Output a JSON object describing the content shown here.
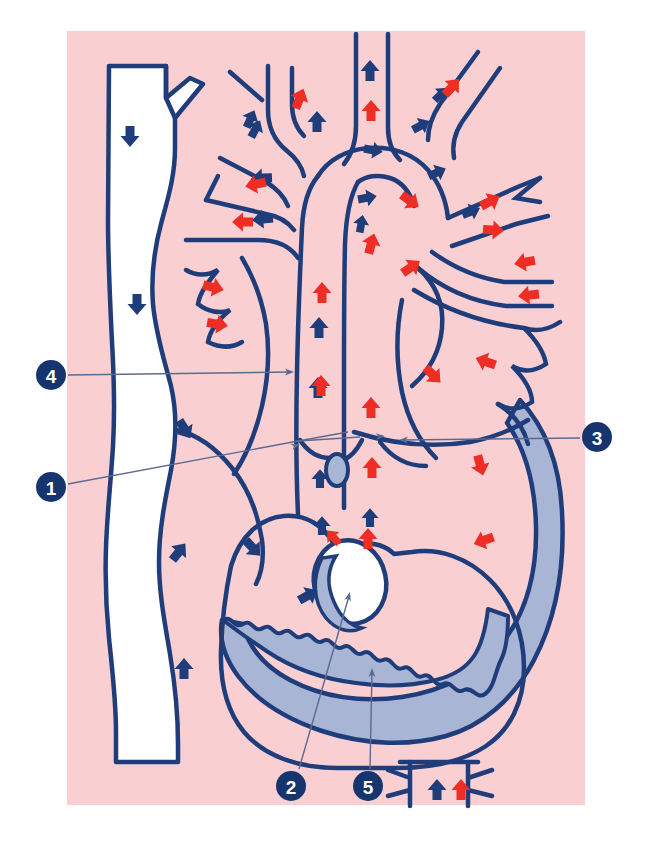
{
  "figure": {
    "type": "anatomical-illustration",
    "canvas": {
      "width": 649,
      "height": 843
    },
    "background": {
      "page_color": "#ffffff",
      "plate_color": "#f9cfd2",
      "plate_rect": {
        "x": 67,
        "y": 31,
        "width": 518,
        "height": 774
      }
    },
    "palette": {
      "outline_blue": "#1f3d7a",
      "deoxygenated_arrow": "#1f3d7a",
      "oxygenated_arrow": "#ee2e24",
      "myocardium_fill": "#a9b5d4",
      "lumen_fill": "#ffffff",
      "plate_pink": "#f9cfd2",
      "callout_disc": "#16356e",
      "callout_text": "#ffffff",
      "leader_line": "#5a6a92"
    }
  },
  "callouts": [
    {
      "id": "callout-1",
      "number": "1",
      "disc": {
        "cx": 51,
        "cy": 487,
        "r": 15
      },
      "leader_paths": [
        "M 68 484 L 298 441 L 348 432",
        "M 298 441 L 360 437"
      ],
      "arrow_tips": [
        {
          "x": 300,
          "y": 444,
          "angle": -20
        },
        {
          "x": 385,
          "y": 436,
          "angle": -4
        }
      ],
      "target": "ascending aorta / aortic root"
    },
    {
      "id": "callout-2",
      "number": "2",
      "disc": {
        "cx": 291,
        "cy": 786,
        "r": 15
      },
      "leader_paths": [
        "M 299 769 L 349 596"
      ],
      "arrow_tips": [
        {
          "x": 350,
          "y": 592,
          "angle": -74
        }
      ],
      "target": "ventricular septal defect"
    },
    {
      "id": "callout-3",
      "number": "3",
      "disc": {
        "cx": 597,
        "cy": 437,
        "r": 15
      },
      "leader_paths": [
        "M 580 438 L 403 440"
      ],
      "arrow_tips": [
        {
          "x": 399,
          "y": 440,
          "angle": 180
        }
      ],
      "target": "left atrium / left ventricle wall"
    },
    {
      "id": "callout-4",
      "number": "4",
      "disc": {
        "cx": 51,
        "cy": 375,
        "r": 15
      },
      "leader_paths": [
        "M 68 375 L 290 372"
      ],
      "arrow_tips": [
        {
          "x": 294,
          "y": 372,
          "angle": 0
        }
      ],
      "target": "superior vena cava / right atrium inflow"
    },
    {
      "id": "callout-5",
      "number": "5",
      "disc": {
        "cx": 368,
        "cy": 786,
        "r": 15
      },
      "leader_paths": [
        "M 370 769 L 372 672"
      ],
      "arrow_tips": [
        {
          "x": 372,
          "y": 668,
          "angle": -90
        }
      ],
      "target": "interventricular septum"
    }
  ],
  "anatomy_shapes": {
    "plate": "M 67 31 L 585 31 L 585 805 L 67 805 Z",
    "left_vena_cava": "M 107 63 L 167 63 L 167 100 L 186 82 L 199 82 L 199 97 L 176 120 L 176 150 C 176 175 169 196 162 222 C 154 252 152 276 154 302 C 157 334 166 360 172 384 C 178 410 178 438 172 470 C 166 500 160 530 160 560 C 160 590 165 620 170 650 C 175 680 178 710 178 740 L 178 760 L 116 760 L 116 730 C 116 700 113 670 110 640 C 107 610 106 580 107 550 C 108 515 112 480 114 445 C 116 410 115 375 113 340 C 111 300 109 260 108 220 C 107 170 107 115 107 63 Z",
    "svc_branch": "M 113 63 L 113 340",
    "heart_outer": "M 230 560 C 238 534 255 520 278 518 C 300 516 318 528 330 545 L 350 545 C 360 545 370 550 378 558 L 400 558 C 420 555 440 560 458 572 C 480 588 498 610 508 640 C 520 676 520 712 505 738 C 490 762 462 775 430 776 L 330 776 C 292 776 258 762 240 735 C 222 708 218 672 222 640 C 224 612 226 585 230 560 Z",
    "aorta_arch": "M 282 200 C 290 180 305 165 325 158 C 348 150 372 154 390 170 C 404 182 412 198 414 216",
    "septum_defect_ellipse": {
      "cx": 350,
      "cy": 582,
      "rx": 36,
      "ry": 42,
      "rotation": -12
    },
    "descending_aorta": "M 408 758 L 408 802 L 470 802 L 470 758 Z"
  },
  "flow_arrows": {
    "legend": {
      "blue_meaning": "deoxygenated (venous) blood flow",
      "red_meaning": "oxygenated (arterial) blood flow"
    },
    "blue": [
      {
        "x": 130,
        "y": 135,
        "angle": 90,
        "scale": 1.0
      },
      {
        "x": 137,
        "y": 303,
        "angle": 90,
        "scale": 1.0
      },
      {
        "x": 184,
        "y": 428,
        "angle": 58,
        "scale": 1.0
      },
      {
        "x": 178,
        "y": 553,
        "angle": -52,
        "scale": 1.0
      },
      {
        "x": 184,
        "y": 670,
        "angle": -90,
        "scale": 1.0
      },
      {
        "x": 252,
        "y": 547,
        "angle": 47,
        "scale": 1.0
      },
      {
        "x": 307,
        "y": 596,
        "angle": -29,
        "scale": 1.0
      },
      {
        "x": 264,
        "y": 219,
        "angle": 174,
        "scale": 1.0
      },
      {
        "x": 263,
        "y": 178,
        "angle": 178,
        "scale": 1.0
      },
      {
        "x": 250,
        "y": 120,
        "angle": -66,
        "scale": 0.9
      },
      {
        "x": 255,
        "y": 130,
        "angle": -62,
        "scale": 0.9
      },
      {
        "x": 317,
        "y": 123,
        "angle": -90,
        "scale": 1.0
      },
      {
        "x": 370,
        "y": 72,
        "angle": -90,
        "scale": 1.0
      },
      {
        "x": 319,
        "y": 329,
        "angle": -90,
        "scale": 1.0
      },
      {
        "x": 318,
        "y": 389,
        "angle": -90,
        "scale": 1.0
      },
      {
        "x": 320,
        "y": 480,
        "angle": -90,
        "scale": 0.9
      },
      {
        "x": 322,
        "y": 527,
        "angle": -90,
        "scale": 0.9
      },
      {
        "x": 370,
        "y": 519,
        "angle": -90,
        "scale": 0.9
      },
      {
        "x": 361,
        "y": 225,
        "angle": -80,
        "scale": 0.85
      },
      {
        "x": 366,
        "y": 198,
        "angle": -10,
        "scale": 0.9
      },
      {
        "x": 372,
        "y": 150,
        "angle": 10,
        "scale": 0.9
      },
      {
        "x": 436,
        "y": 173,
        "angle": -25,
        "scale": 0.9
      },
      {
        "x": 420,
        "y": 126,
        "angle": -28,
        "scale": 0.9
      },
      {
        "x": 470,
        "y": 212,
        "angle": -22,
        "scale": 0.9
      },
      {
        "x": 440,
        "y": 95,
        "angle": -45,
        "scale": 0.85
      },
      {
        "x": 437,
        "y": 791,
        "angle": -90,
        "scale": 1.0
      }
    ],
    "red": [
      {
        "x": 299,
        "y": 100,
        "angle": -68,
        "scale": 1.0
      },
      {
        "x": 371,
        "y": 112,
        "angle": -90,
        "scale": 1.0
      },
      {
        "x": 451,
        "y": 88,
        "angle": -48,
        "scale": 1.0
      },
      {
        "x": 257,
        "y": 184,
        "angle": 168,
        "scale": 1.0
      },
      {
        "x": 244,
        "y": 222,
        "angle": 180,
        "scale": 1.0
      },
      {
        "x": 409,
        "y": 200,
        "angle": 36,
        "scale": 1.0
      },
      {
        "x": 371,
        "y": 245,
        "angle": -75,
        "scale": 1.0
      },
      {
        "x": 410,
        "y": 268,
        "angle": -35,
        "scale": 1.0
      },
      {
        "x": 489,
        "y": 202,
        "angle": -28,
        "scale": 1.0
      },
      {
        "x": 492,
        "y": 230,
        "angle": 4,
        "scale": 1.0
      },
      {
        "x": 212,
        "y": 287,
        "angle": 14,
        "scale": 1.0
      },
      {
        "x": 216,
        "y": 324,
        "angle": 10,
        "scale": 1.0
      },
      {
        "x": 322,
        "y": 294,
        "angle": -90,
        "scale": 1.0
      },
      {
        "x": 321,
        "y": 387,
        "angle": -90,
        "scale": 1.0
      },
      {
        "x": 371,
        "y": 409,
        "angle": -90,
        "scale": 1.0
      },
      {
        "x": 372,
        "y": 469,
        "angle": -90,
        "scale": 1.0
      },
      {
        "x": 368,
        "y": 540,
        "angle": -90,
        "scale": 1.0
      },
      {
        "x": 334,
        "y": 538,
        "angle": -132,
        "scale": 0.85
      },
      {
        "x": 526,
        "y": 262,
        "angle": 170,
        "scale": 1.0
      },
      {
        "x": 530,
        "y": 295,
        "angle": 174,
        "scale": 1.0
      },
      {
        "x": 432,
        "y": 374,
        "angle": 45,
        "scale": 1.0
      },
      {
        "x": 487,
        "y": 362,
        "angle": 200,
        "scale": 1.0
      },
      {
        "x": 480,
        "y": 464,
        "angle": 75,
        "scale": 1.0
      },
      {
        "x": 485,
        "y": 540,
        "angle": 160,
        "scale": 1.0
      },
      {
        "x": 461,
        "y": 791,
        "angle": -90,
        "scale": 1.0
      }
    ]
  }
}
